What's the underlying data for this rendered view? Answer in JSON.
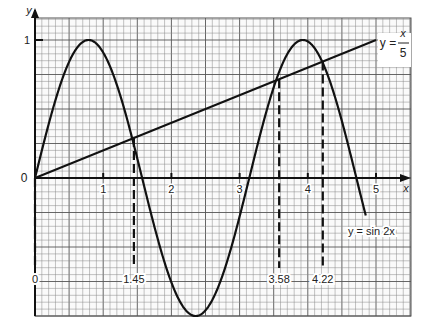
{
  "chart_data": {
    "type": "line",
    "title": "",
    "xlabel": "x",
    "ylabel": "y",
    "xlim": [
      0,
      5.5
    ],
    "ylim": [
      -1,
      1.15
    ],
    "grid": true,
    "x_ticks": [
      "1",
      "2",
      "3",
      "4",
      "5"
    ],
    "y_ticks": [
      "0",
      "1"
    ],
    "series": [
      {
        "name": "y = sin 2x",
        "function": "sin(2x)",
        "x_range": [
          0,
          4.85
        ]
      },
      {
        "name": "y = x/5",
        "function": "x/5",
        "x_range": [
          0,
          5.0
        ]
      }
    ],
    "intersections": [
      {
        "x": 0,
        "label": "0"
      },
      {
        "x": 1.45,
        "label": "1.45"
      },
      {
        "x": 3.58,
        "label": "3.58"
      },
      {
        "x": 4.22,
        "label": "4.22"
      }
    ],
    "annotations": {
      "line_label_lhs": "y =",
      "line_label_num": "x",
      "line_label_den": "5",
      "curve_label": "y = sin 2x"
    }
  },
  "axes": {
    "x_label": "x",
    "y_label": "y",
    "origin_label": "0",
    "y_one_label": "1"
  }
}
